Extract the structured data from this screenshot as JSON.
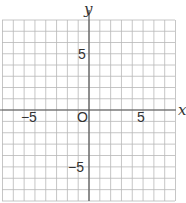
{
  "chart_data": {
    "type": "coordinate-grid",
    "title": "",
    "xlabel": "x",
    "ylabel": "y",
    "xlim": [
      -8,
      8
    ],
    "ylim": [
      -8,
      8
    ],
    "grid": true,
    "grid_step": 1,
    "tick_labels": {
      "x": [
        {
          "value": -5,
          "label": "−5"
        },
        {
          "value": 5,
          "label": "5"
        }
      ],
      "y": [
        {
          "value": 5,
          "label": "5"
        },
        {
          "value": -5,
          "label": "−5"
        }
      ]
    },
    "origin_label": "O",
    "series": []
  },
  "colors": {
    "grid": "#b8b8b8",
    "axis": "#555555",
    "text": "#333333"
  }
}
